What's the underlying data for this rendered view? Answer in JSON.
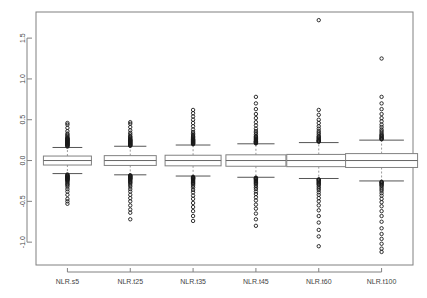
{
  "chart_data": {
    "type": "box",
    "title": "",
    "xlabel": "",
    "ylabel": "",
    "ylim": [
      -1.28,
      1.82
    ],
    "grid": false,
    "legend": "none",
    "y_ticks": [
      "1.5",
      "1.0",
      "0.5",
      "0.0",
      "-0.5",
      "-1.0"
    ],
    "y_tick_values": [
      1.5,
      1.0,
      0.5,
      0.0,
      -0.5,
      -1.0
    ],
    "categories": [
      "NLR.s5",
      "NLR.t25",
      "NLR.t35",
      "NLR.t45",
      "NLR.t60",
      "NLR.t100"
    ],
    "boxes": [
      {
        "name": "NLR.s5",
        "q1": -0.055,
        "median": 0.0,
        "q3": 0.055,
        "whisker_low": -0.16,
        "whisker_high": 0.16,
        "box_half_width": 24,
        "outliers_high": [
          0.17,
          0.18,
          0.185,
          0.19,
          0.195,
          0.2,
          0.205,
          0.21,
          0.215,
          0.22,
          0.225,
          0.23,
          0.235,
          0.24,
          0.245,
          0.25,
          0.255,
          0.26,
          0.265,
          0.27,
          0.275,
          0.285,
          0.3,
          0.315,
          0.33,
          0.36,
          0.4,
          0.44,
          0.46
        ],
        "outliers_low": [
          -0.17,
          -0.18,
          -0.185,
          -0.19,
          -0.195,
          -0.2,
          -0.205,
          -0.21,
          -0.215,
          -0.22,
          -0.225,
          -0.23,
          -0.235,
          -0.24,
          -0.25,
          -0.26,
          -0.275,
          -0.29,
          -0.3,
          -0.32,
          -0.35,
          -0.38,
          -0.42,
          -0.47,
          -0.5,
          -0.53
        ]
      },
      {
        "name": "NLR.t25",
        "q1": -0.06,
        "median": 0.0,
        "q3": 0.06,
        "whisker_low": -0.175,
        "whisker_high": 0.175,
        "box_half_width": 26,
        "outliers_high": [
          0.18,
          0.185,
          0.19,
          0.195,
          0.2,
          0.205,
          0.21,
          0.215,
          0.22,
          0.225,
          0.23,
          0.235,
          0.24,
          0.245,
          0.25,
          0.255,
          0.26,
          0.27,
          0.28,
          0.29,
          0.3,
          0.32,
          0.34,
          0.37,
          0.41,
          0.45,
          0.47
        ],
        "outliers_low": [
          -0.18,
          -0.185,
          -0.19,
          -0.195,
          -0.2,
          -0.205,
          -0.21,
          -0.215,
          -0.22,
          -0.225,
          -0.23,
          -0.24,
          -0.25,
          -0.26,
          -0.27,
          -0.28,
          -0.3,
          -0.32,
          -0.35,
          -0.38,
          -0.42,
          -0.46,
          -0.5,
          -0.55,
          -0.6,
          -0.64,
          -0.72
        ]
      },
      {
        "name": "NLR.t35",
        "q1": -0.065,
        "median": 0.0,
        "q3": 0.065,
        "whisker_low": -0.19,
        "whisker_high": 0.19,
        "box_half_width": 28,
        "outliers_high": [
          0.2,
          0.205,
          0.21,
          0.215,
          0.22,
          0.225,
          0.23,
          0.235,
          0.24,
          0.245,
          0.25,
          0.255,
          0.26,
          0.27,
          0.28,
          0.29,
          0.3,
          0.315,
          0.33,
          0.35,
          0.38,
          0.42,
          0.46,
          0.5,
          0.54,
          0.58,
          0.62
        ],
        "outliers_low": [
          -0.2,
          -0.205,
          -0.21,
          -0.215,
          -0.22,
          -0.225,
          -0.23,
          -0.24,
          -0.25,
          -0.26,
          -0.27,
          -0.28,
          -0.29,
          -0.31,
          -0.33,
          -0.36,
          -0.39,
          -0.43,
          -0.47,
          -0.52,
          -0.57,
          -0.62,
          -0.68,
          -0.74
        ]
      },
      {
        "name": "NLR.t45",
        "q1": -0.07,
        "median": 0.0,
        "q3": 0.07,
        "whisker_low": -0.205,
        "whisker_high": 0.205,
        "box_half_width": 30,
        "outliers_high": [
          0.21,
          0.215,
          0.22,
          0.225,
          0.23,
          0.235,
          0.24,
          0.25,
          0.26,
          0.27,
          0.28,
          0.29,
          0.3,
          0.32,
          0.34,
          0.36,
          0.39,
          0.43,
          0.47,
          0.52,
          0.57,
          0.63,
          0.7,
          0.78
        ],
        "outliers_low": [
          -0.21,
          -0.215,
          -0.22,
          -0.225,
          -0.23,
          -0.24,
          -0.25,
          -0.26,
          -0.27,
          -0.28,
          -0.29,
          -0.31,
          -0.33,
          -0.35,
          -0.38,
          -0.41,
          -0.45,
          -0.49,
          -0.54,
          -0.59,
          -0.65,
          -0.72,
          -0.8
        ]
      },
      {
        "name": "NLR.t60",
        "q1": -0.075,
        "median": 0.0,
        "q3": 0.075,
        "whisker_low": -0.22,
        "whisker_high": 0.22,
        "box_half_width": 32,
        "outliers_high": [
          0.23,
          0.235,
          0.24,
          0.245,
          0.25,
          0.26,
          0.27,
          0.28,
          0.29,
          0.3,
          0.32,
          0.34,
          0.36,
          0.39,
          0.42,
          0.46,
          0.5,
          0.56,
          0.62,
          1.72
        ],
        "outliers_low": [
          -0.23,
          -0.235,
          -0.24,
          -0.25,
          -0.26,
          -0.27,
          -0.28,
          -0.29,
          -0.3,
          -0.32,
          -0.34,
          -0.36,
          -0.39,
          -0.42,
          -0.46,
          -0.5,
          -0.55,
          -0.61,
          -0.68,
          -0.76,
          -0.85,
          -0.93,
          -1.05
        ]
      },
      {
        "name": "NLR.t100",
        "q1": -0.085,
        "median": 0.0,
        "q3": 0.085,
        "whisker_low": -0.25,
        "whisker_high": 0.25,
        "box_half_width": 36,
        "outliers_high": [
          0.26,
          0.265,
          0.27,
          0.28,
          0.29,
          0.3,
          0.31,
          0.32,
          0.34,
          0.36,
          0.38,
          0.41,
          0.44,
          0.48,
          0.52,
          0.57,
          0.63,
          0.7,
          0.78,
          1.25
        ],
        "outliers_low": [
          -0.26,
          -0.265,
          -0.27,
          -0.28,
          -0.29,
          -0.3,
          -0.31,
          -0.33,
          -0.35,
          -0.37,
          -0.4,
          -0.43,
          -0.47,
          -0.51,
          -0.56,
          -0.62,
          -0.68,
          -0.75,
          -0.83,
          -0.9,
          -0.96,
          -1.02,
          -1.08,
          -1.12
        ]
      }
    ]
  },
  "colors": {
    "background": "#ffffff",
    "frame": "#808080",
    "box_stroke": "#808080",
    "median": "#666666",
    "whisker": "#999999",
    "outlier": "#1a1a1a",
    "tick_label": "#444444"
  }
}
